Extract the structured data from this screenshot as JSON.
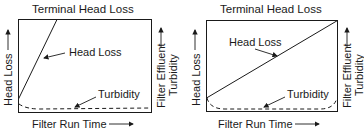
{
  "panels": [
    {
      "id": "left",
      "title": "Terminal Head Loss",
      "curve_label": "Head Loss",
      "turbidity_label": "Turbidity",
      "y_left_label": "Head Loss",
      "y_right_label_line1": "Filter Effluent",
      "y_right_label_line2": "Turbidity",
      "x_label": "Filter Run Time"
    },
    {
      "id": "right",
      "title": "Terminal Head Loss",
      "curve_label": "Head Loss",
      "turbidity_label": "Turbidity",
      "y_left_label": "Head Loss",
      "y_right_label_line1": "Filter Effluent",
      "y_right_label_line2": "Turbidity",
      "x_label": "Filter Run Time"
    }
  ],
  "colors": {
    "ink": "#1a1a1a",
    "background": "#ffffff"
  }
}
